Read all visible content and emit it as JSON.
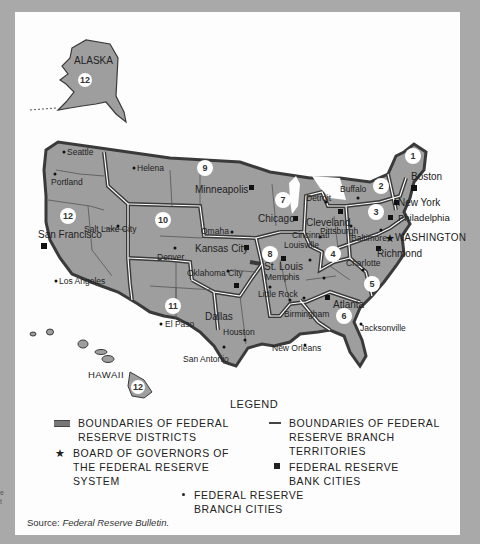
{
  "map": {
    "title": "Federal Reserve Districts Map",
    "regions": {
      "alaska": "ALASKA",
      "hawaii": "HAWAII",
      "washington": "WASHINGTON"
    },
    "district_numbers": [
      "1",
      "2",
      "3",
      "4",
      "5",
      "6",
      "7",
      "8",
      "9",
      "10",
      "11",
      "12",
      "12",
      "12"
    ],
    "bank_cities": [
      "Boston",
      "New York",
      "Philadelphia",
      "Cleveland",
      "Richmond",
      "Atlanta",
      "Chicago",
      "St. Louis",
      "Minneapolis",
      "Kansas City",
      "Dallas",
      "San Francisco"
    ],
    "branch_cities": [
      "Seattle",
      "Portland",
      "Helena",
      "Salt Lake City",
      "Los Angeles",
      "Denver",
      "Omaha",
      "Oklahoma City",
      "El Paso",
      "Houston",
      "San Antonio",
      "Little Rock",
      "Memphis",
      "Louisville",
      "Cincinnati",
      "Pittsburgh",
      "Buffalo",
      "Detroit",
      "Baltimore",
      "Charlotte",
      "Birmingham",
      "Nashville",
      "New Orleans",
      "Jacksonville"
    ],
    "labels": {
      "seattle": "Seattle",
      "portland": "Portland",
      "helena": "Helena",
      "minneapolis": "Minneapolis",
      "san_francisco": "San Francisco",
      "salt_lake_city": "Salt Lake City",
      "los_angeles": "Los Angeles",
      "denver": "Denver",
      "omaha": "Omaha",
      "kansas_city": "Kansas City",
      "oklahoma_city": "Oklahoma City",
      "dallas": "Dallas",
      "el_paso": "El Paso",
      "houston": "Houston",
      "san_antonio": "San Antonio",
      "chicago": "Chicago",
      "detroit": "Detroit",
      "buffalo": "Buffalo",
      "cleveland": "Cleveland",
      "cincinnati": "Cincinnati",
      "louisville": "Louisville",
      "st_louis": "St. Louis",
      "memphis": "Memphis",
      "little_rock": "Little Rock",
      "birmingham": "Birmingham",
      "atlanta": "Atlanta",
      "new_orleans": "New Orleans",
      "jacksonville": "Jacksonville",
      "charlotte": "Charlotte",
      "richmond": "Richmond",
      "boston": "Boston",
      "new_york": "New York",
      "philadelphia": "Philadelphia",
      "pittsburgh": "Pittsburgh",
      "baltimore": "Baltimore"
    },
    "colors": {
      "land": "#9e9e9e",
      "district_border": "#3a3a3a",
      "background": "#a9a9a9",
      "panel": "#fdfdfd"
    }
  },
  "legend": {
    "title": "LEGEND",
    "items": [
      {
        "symbol": "double-line",
        "line1": "BOUNDARIES OF FEDERAL",
        "line2": "RESERVE DISTRICTS"
      },
      {
        "symbol": "thin-line",
        "line1": "BOUNDARIES OF FEDERAL",
        "line2": "RESERVE BRANCH",
        "line3": "TERRITORIES"
      },
      {
        "symbol": "star",
        "line1": "BOARD OF GOVERNORS OF",
        "line2": "THE FEDERAL RESERVE",
        "line3": "SYSTEM"
      },
      {
        "symbol": "square",
        "line1": "FEDERAL RESERVE",
        "line2": "BANK CITIES"
      },
      {
        "symbol": "dot",
        "line1": "FEDERAL RESERVE",
        "line2": "BRANCH CITIES"
      }
    ],
    "symbols": {
      "star": "★",
      "square": "■",
      "dot": "•"
    }
  },
  "source": {
    "prefix": "Source:",
    "citation": "Federal Reserve Bulletin."
  },
  "edge_text": {
    "line1": "e",
    "line2": "t"
  }
}
